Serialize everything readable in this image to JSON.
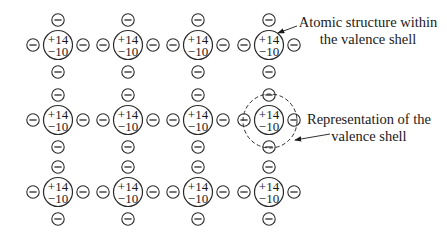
{
  "diagram": {
    "type": "silicon-crystal-lattice",
    "atom": {
      "nucleus_charge": "+14",
      "inner_electrons": "−10"
    },
    "electron_symbol": "minus-in-circle",
    "grid": {
      "columns": [
        58,
        128,
        198,
        269
      ],
      "rows": [
        45,
        120,
        192
      ]
    },
    "highlighted_atom": {
      "column": 4,
      "row": 2
    },
    "callouts": [
      {
        "id": "atomic-structure",
        "lines": [
          "Atomic structure within",
          "the valence shell"
        ],
        "x": 368,
        "y": [
          27,
          44
        ],
        "arrow": {
          "from": [
            297,
            26
          ],
          "to": [
            278,
            33
          ]
        }
      },
      {
        "id": "valence-shell",
        "lines": [
          "Representation of the",
          "valence shell"
        ],
        "x": 369,
        "y": [
          124,
          141
        ],
        "arrow": {
          "from": [
            330,
            134
          ],
          "to": [
            295,
            140
          ]
        }
      }
    ],
    "colors": {
      "stroke": "#2a2a2a",
      "text": "#1a1a1a",
      "background": "#ffffff"
    }
  }
}
